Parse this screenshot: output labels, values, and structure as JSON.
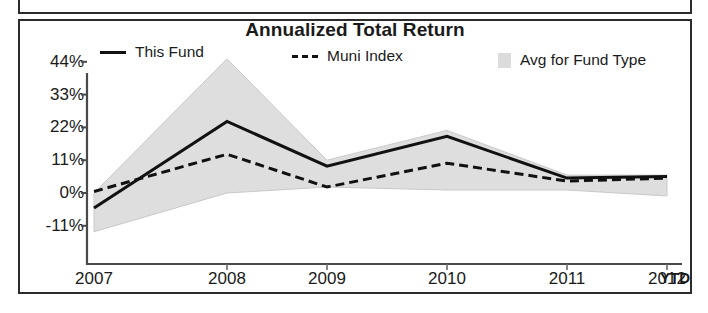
{
  "chart_box": {
    "title": "Annualized Total Return",
    "ytd_label": "YTD"
  },
  "legend": {
    "items": [
      {
        "label": "This Fund",
        "marker": "solid-line-swatch",
        "color": "#111111"
      },
      {
        "label": "Muni Index",
        "marker": "dashed-line-swatch",
        "color": "#111111"
      },
      {
        "label": "Avg for Fund Type",
        "marker": "shaded-band-swatch",
        "color": "#dcdcdc"
      }
    ]
  },
  "chart_data": {
    "type": "line",
    "title": "Annualized Total Return",
    "xlabel": "",
    "ylabel": "",
    "grid": false,
    "legend_position": "top",
    "categories": [
      "2007",
      "2008",
      "2009",
      "2010",
      "2011",
      "2012"
    ],
    "x_last_suffix": "YTD",
    "ylim": [
      -11,
      44
    ],
    "yticks": [
      -11,
      0,
      11,
      22,
      33,
      44
    ],
    "ytick_labels": [
      "-11%",
      "0%",
      "11%",
      "22%",
      "33%",
      "44%"
    ],
    "series": [
      {
        "name": "This Fund",
        "style": "solid",
        "values": [
          -5,
          24,
          9,
          19,
          5,
          5.5
        ]
      },
      {
        "name": "Muni Index",
        "style": "dashed",
        "values": [
          0.5,
          13,
          2,
          10,
          4,
          5
        ]
      }
    ],
    "band": {
      "name": "Avg for Fund Type",
      "style": "shaded",
      "upper": [
        0,
        45,
        11,
        21,
        6,
        6
      ],
      "lower": [
        -13,
        0,
        2,
        1,
        1,
        -1
      ]
    }
  }
}
